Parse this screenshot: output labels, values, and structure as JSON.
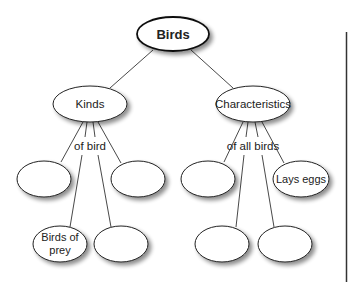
{
  "diagram": {
    "type": "concept-map",
    "colors": {
      "stroke": "#1a1a1a",
      "fill": "#ffffff",
      "shadow": "#9a9a9a",
      "text": "#222222",
      "background": "#ffffff"
    },
    "root": {
      "label": "Birds"
    },
    "branches": [
      {
        "label": "Kinds",
        "link_label": "of bird",
        "children": [
          {
            "label": ""
          },
          {
            "label": ""
          },
          {
            "label_line1": "Birds of",
            "label_line2": "prey"
          },
          {
            "label": ""
          }
        ]
      },
      {
        "label": "Characteristics",
        "link_label": "of all birds",
        "children": [
          {
            "label": ""
          },
          {
            "label": "Lays eggs"
          },
          {
            "label": ""
          },
          {
            "label": ""
          }
        ]
      }
    ]
  }
}
